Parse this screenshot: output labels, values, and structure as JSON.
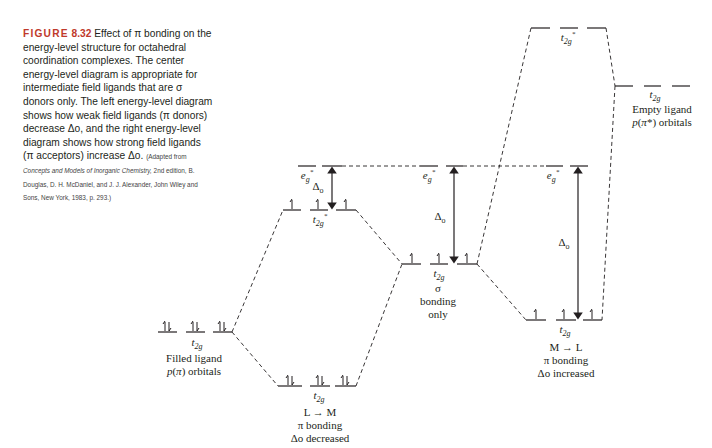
{
  "caption": {
    "figure_label": "FIGURE",
    "figure_number": "8.32",
    "text": "Effect of π bonding on the energy-level structure for octahedral coordination complexes. The center energy-level diagram is appropriate for intermediate field ligands that are σ donors only. The left energy-level diagram shows how weak field ligands (π donors) decrease Δo, and the right energy-level diagram shows how strong field ligands (π acceptors) increase Δo.",
    "source_prefix": "(Adapted from ",
    "source_title": "Concepts and Models of Inorganic Chemistry,",
    "source_rest": " 2nd edition, B. Douglas, D. H. McDaniel, and J. J. Alexander, John Wiley and Sons, New York, 1983, p. 293.)"
  },
  "diagram": {
    "filled_ligand": {
      "orbital": "t2g",
      "label_line1": "Filled ligand",
      "label_line2": "p(π) orbitals",
      "electrons": "paired"
    },
    "l_to_m": {
      "upper_eg": "eg*",
      "upper_t2g": "t2g*",
      "lower_t2g": "t2g",
      "delta": "Δo",
      "label_line1": "L → M",
      "label_line2": "π bonding",
      "label_line3": "Δo decreased"
    },
    "sigma_only": {
      "eg": "eg*",
      "t2g": "t2g",
      "delta": "Δo",
      "label_line1": "σ",
      "label_line2": "bonding",
      "label_line3": "only"
    },
    "m_to_l": {
      "eg": "eg*",
      "t2g": "t2g",
      "upper_t2g": "t2g*",
      "delta": "Δo",
      "label_line1": "M → L",
      "label_line2": "π bonding",
      "label_line3": "Δo increased"
    },
    "empty_ligand": {
      "orbital": "t2g",
      "label_line1": "Empty ligand",
      "label_line2": "p(π*) orbitals"
    }
  }
}
